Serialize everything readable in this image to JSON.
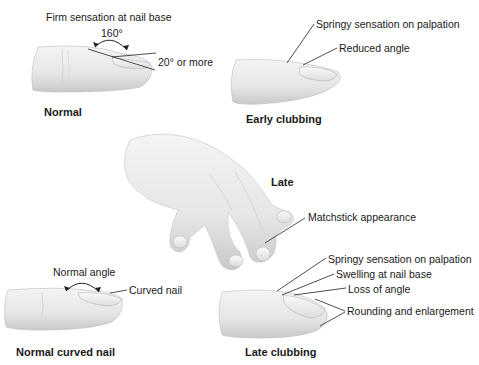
{
  "panels": {
    "normal": {
      "caption": "Normal",
      "labels": {
        "firm": "Firm sensation at nail base",
        "angle": "160°",
        "twenty": "20° or more"
      }
    },
    "early": {
      "caption": "Early clubbing",
      "labels": {
        "springy": "Springy sensation on palpation",
        "reduced": "Reduced angle"
      }
    },
    "late_hand": {
      "caption": "Late",
      "labels": {
        "matchstick": "Matchstick appearance"
      }
    },
    "curved": {
      "caption": "Normal curved nail",
      "labels": {
        "normal_angle": "Normal angle",
        "curved": "Curved nail"
      }
    },
    "late_clubbing": {
      "caption": "Late clubbing",
      "labels": {
        "springy": "Springy sensation on palpation",
        "swelling": "Swelling at nail base",
        "loss": "Loss of angle",
        "rounding": "Rounding and enlargement"
      }
    }
  },
  "colors": {
    "skin": "#e9e9e9",
    "skin_shadow": "#c9c9c9",
    "line": "#222222"
  }
}
